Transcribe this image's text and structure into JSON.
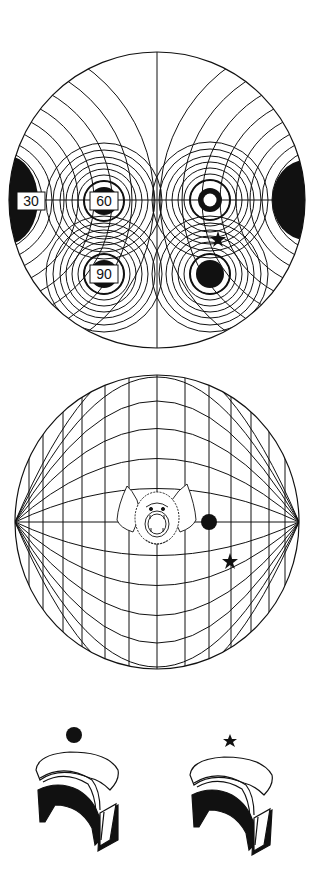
{
  "colors": {
    "ink": "#111111",
    "paper": "#ffffff"
  },
  "panel_top": {
    "description": "Polar field map with iso-contour rings centered on sound sources",
    "center": [
      157,
      200
    ],
    "radius": 148,
    "labels": [
      {
        "text": "30",
        "x": 31,
        "y": 201
      },
      {
        "text": "60",
        "x": 104,
        "y": 201
      },
      {
        "text": "90",
        "x": 104,
        "y": 274
      }
    ],
    "markers": {
      "ring": {
        "x": 210,
        "y": 200,
        "r_outer": 12,
        "r_inner": 6.5
      },
      "dot": {
        "x": 210,
        "y": 274,
        "r": 14
      },
      "star": {
        "x": 218,
        "y": 239
      }
    }
  },
  "panel_middle": {
    "description": "Globe grid with bat head at center",
    "center": [
      157,
      522
    ],
    "rx": 142,
    "ry": 147,
    "markers": {
      "dot": {
        "x": 209,
        "y": 522,
        "r": 8
      },
      "star": {
        "x": 230,
        "y": 561
      }
    },
    "subject_icon": "bat-head-icon"
  },
  "panel_bottom": {
    "description": "Two ear-shaped sensors with stimulus markers",
    "items": [
      {
        "marker": "dot",
        "marker_x": 74,
        "marker_y": 735
      },
      {
        "marker": "star",
        "marker_x": 230,
        "marker_y": 741
      }
    ]
  }
}
